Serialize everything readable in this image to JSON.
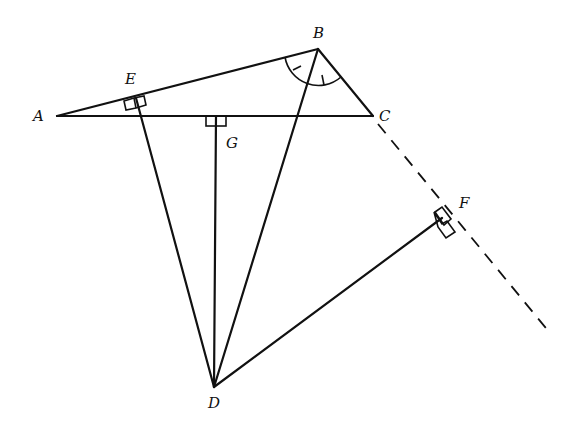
{
  "diagram": {
    "type": "geometry-figure",
    "points": {
      "A": {
        "label": "A",
        "x": 57,
        "y": 116
      },
      "B": {
        "label": "B",
        "x": 318,
        "y": 49
      },
      "C": {
        "label": "C",
        "x": 373,
        "y": 116
      },
      "D": {
        "label": "D",
        "x": 214,
        "y": 387
      },
      "E": {
        "label": "E",
        "x": 136,
        "y": 98
      },
      "F": {
        "label": "F",
        "x": 442,
        "y": 218
      },
      "G": {
        "label": "G",
        "x": 216,
        "y": 116
      }
    },
    "segments": [
      "AB",
      "BC",
      "AC",
      "BD",
      "DE",
      "DG",
      "DF"
    ],
    "dashed_lines": [
      "C to F extended beyond F"
    ],
    "right_angles": [
      "E (DE ⟂ AB)",
      "G (DG ⟂ AC)",
      "F (DF ⟂ line BC extended)"
    ],
    "angle_marks": [
      "angle ABD equals angle DBC (bisector marks at B)"
    ]
  }
}
